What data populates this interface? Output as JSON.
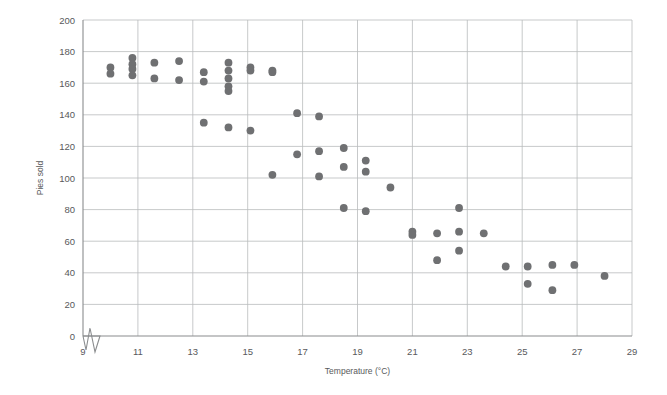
{
  "chart_data": {
    "type": "scatter",
    "title": "",
    "xlabel": "Temperature (°C)",
    "ylabel": "Pies sold",
    "xlim": [
      9,
      29
    ],
    "ylim": [
      0,
      200
    ],
    "xticks": [
      9,
      11,
      13,
      15,
      17,
      19,
      21,
      23,
      25,
      27,
      29
    ],
    "yticks": [
      0,
      20,
      40,
      60,
      80,
      100,
      120,
      140,
      160,
      180,
      200
    ],
    "xtick_labels": [
      "9",
      "11",
      "13",
      "15",
      "17",
      "19",
      "21",
      "23",
      "25",
      "27",
      "29"
    ],
    "ytick_labels": [
      "0",
      "20",
      "40",
      "60",
      "80",
      "100",
      "120",
      "140",
      "160",
      "180",
      "200"
    ],
    "grid": true,
    "legend": null,
    "axis_break": {
      "axis": "x",
      "note": "zigzag break between origin and first tick"
    },
    "marker_color": "#6f7072",
    "points": [
      [
        10.0,
        170
      ],
      [
        10.0,
        166
      ],
      [
        10.8,
        176
      ],
      [
        10.8,
        172
      ],
      [
        10.8,
        169
      ],
      [
        10.8,
        165
      ],
      [
        11.6,
        173
      ],
      [
        11.6,
        163
      ],
      [
        12.5,
        174
      ],
      [
        12.5,
        162
      ],
      [
        13.4,
        167
      ],
      [
        13.4,
        161
      ],
      [
        13.4,
        135
      ],
      [
        14.3,
        173
      ],
      [
        14.3,
        168
      ],
      [
        14.3,
        163
      ],
      [
        14.3,
        158
      ],
      [
        14.3,
        155
      ],
      [
        14.3,
        132
      ],
      [
        15.1,
        170
      ],
      [
        15.1,
        168
      ],
      [
        15.1,
        130
      ],
      [
        15.9,
        168
      ],
      [
        15.9,
        167
      ],
      [
        15.9,
        102
      ],
      [
        16.8,
        141
      ],
      [
        16.8,
        115
      ],
      [
        17.6,
        139
      ],
      [
        17.6,
        117
      ],
      [
        17.6,
        101
      ],
      [
        18.5,
        119
      ],
      [
        18.5,
        107
      ],
      [
        18.5,
        81
      ],
      [
        19.3,
        111
      ],
      [
        19.3,
        104
      ],
      [
        19.3,
        79
      ],
      [
        20.2,
        94
      ],
      [
        21.0,
        66
      ],
      [
        21.0,
        64
      ],
      [
        21.9,
        65
      ],
      [
        21.9,
        48
      ],
      [
        22.7,
        81
      ],
      [
        22.7,
        66
      ],
      [
        22.7,
        54
      ],
      [
        23.6,
        65
      ],
      [
        24.4,
        44
      ],
      [
        25.2,
        44
      ],
      [
        25.2,
        33
      ],
      [
        26.1,
        45
      ],
      [
        26.1,
        29
      ],
      [
        26.9,
        45
      ],
      [
        28.0,
        38
      ]
    ]
  }
}
